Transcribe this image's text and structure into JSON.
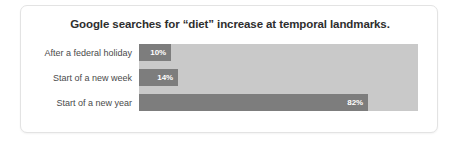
{
  "chart_data": {
    "type": "bar",
    "orientation": "horizontal",
    "title": "Google searches for “diet” increase at temporal landmarks.",
    "xlabel": "",
    "ylabel": "",
    "grid": false,
    "legend": false,
    "xlim": [
      0,
      100
    ],
    "categories": [
      "After a federal holiday",
      "Start of a new week",
      "Start of a new year"
    ],
    "values": [
      10,
      14,
      82
    ],
    "value_labels": [
      "10%",
      "14%",
      "82%"
    ],
    "colors": {
      "bar": "#7d7d7d",
      "track": "#c9c9c9",
      "title_text": "#2e2e2e",
      "category_text": "#4a4a4a",
      "value_text": "#ffffff",
      "card_background": "#ffffff",
      "card_border": "#e3e3e3"
    }
  }
}
